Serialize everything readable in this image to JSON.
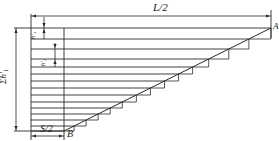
{
  "figure": {
    "width": 279,
    "height": 141,
    "stroke_color": "#2a2a2a",
    "background": "#ffffff"
  },
  "labels": {
    "top_dimension": "L/2",
    "point_a": "A",
    "point_b": "B",
    "bottom_dimension": "S/2",
    "left_dimension": "Σh'₁",
    "h1": "h'₁",
    "h2": "h'₂"
  },
  "geometry": {
    "outer_left_x": 31,
    "inner_left_x": 64,
    "right_x": 271,
    "top_y": 28,
    "bottom_y": 131,
    "horizontal_lines_y": [
      28,
      39,
      49,
      59,
      67,
      74,
      81,
      88,
      95,
      102,
      108,
      114,
      120,
      126,
      131
    ],
    "point_a": [
      271,
      28
    ],
    "point_b": [
      64,
      131
    ]
  }
}
